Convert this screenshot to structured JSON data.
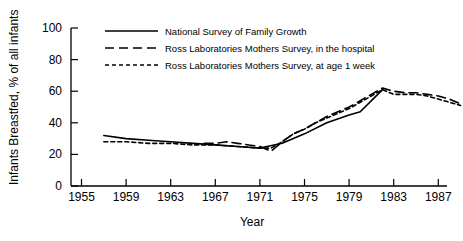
{
  "chart_data": {
    "type": "line",
    "title": "",
    "xlabel": "Year",
    "ylabel": "Infants Breastfed, % of all infants",
    "xlim": [
      1955,
      1991
    ],
    "ylim": [
      0,
      100
    ],
    "xticks": [
      1955,
      1959,
      1963,
      1967,
      1971,
      1975,
      1979,
      1983,
      1987
    ],
    "yticks": [
      0,
      20,
      40,
      60,
      80,
      100
    ],
    "grid": false,
    "legend_position": "top-center",
    "series": [
      {
        "name": "National Survey of Family Growth",
        "style": "solid",
        "x": [
          1957,
          1959,
          1961,
          1963,
          1965,
          1967,
          1969,
          1971,
          1973,
          1975,
          1977,
          1979,
          1980,
          1982
        ],
        "values": [
          32,
          30,
          29,
          28,
          27,
          26,
          25,
          24,
          27,
          33,
          40,
          45,
          47,
          61
        ]
      },
      {
        "name": "Ross Laboratories Mothers Survey, in the hospital",
        "style": "dashed",
        "x": [
          1966,
          1967,
          1968,
          1969,
          1970,
          1971,
          1972,
          1973,
          1974,
          1975,
          1976,
          1977,
          1978,
          1979,
          1980,
          1981,
          1982,
          1983,
          1984,
          1985,
          1986,
          1987,
          1988,
          1989
        ],
        "values": [
          27,
          27,
          28,
          27,
          26,
          25,
          22,
          28,
          33,
          36,
          40,
          44,
          47,
          50,
          54,
          58,
          62,
          60,
          59,
          59,
          58,
          57,
          55,
          52
        ]
      },
      {
        "name": "Ross Laboratories Mothers Survey, at age 1 week",
        "style": "dotted",
        "x": [
          1957,
          1959,
          1961,
          1963,
          1965,
          1967,
          1969,
          1971,
          1972,
          1973,
          1974,
          1975,
          1976,
          1977,
          1978,
          1979,
          1980,
          1981,
          1982,
          1983,
          1984,
          1985,
          1986,
          1987,
          1988,
          1989
        ],
        "values": [
          28,
          28,
          27,
          27,
          26,
          26,
          25,
          24,
          24,
          28,
          33,
          36,
          40,
          43,
          46,
          49,
          53,
          57,
          61,
          58,
          58,
          58,
          57,
          55,
          53,
          51
        ]
      }
    ]
  },
  "axes": {
    "ylabel": "Infants Breastfed, % of all infants",
    "xlabel": "Year",
    "ytick_labels": [
      "100",
      "80",
      "60",
      "40",
      "20",
      "0"
    ],
    "xtick_labels": [
      "1955",
      "1959",
      "1963",
      "1967",
      "1971",
      "1975",
      "1979",
      "1983",
      "1987"
    ]
  },
  "legend": {
    "items": [
      {
        "label": "National Survey of Family Growth",
        "style": "solid"
      },
      {
        "label": "Ross Laboratories Mothers Survey, in the hospital",
        "style": "dashed"
      },
      {
        "label": "Ross Laboratories Mothers Survey, at age 1 week",
        "style": "dotted"
      }
    ]
  },
  "colors": {
    "ink": "#000000",
    "background": "#ffffff"
  }
}
